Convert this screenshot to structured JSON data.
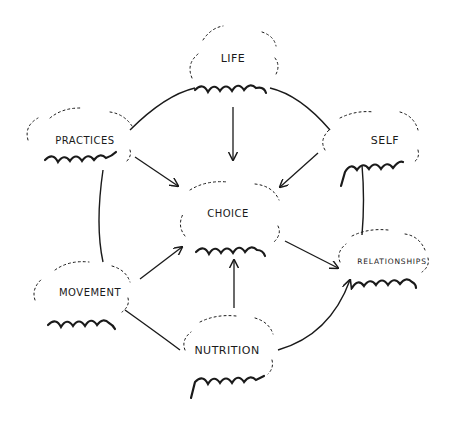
{
  "diagram": {
    "type": "concept-map",
    "center": {
      "id": "choice",
      "label": "CHOICE"
    },
    "nodes": [
      {
        "id": "life",
        "label": "LIFE",
        "x": 233,
        "y": 58
      },
      {
        "id": "practices",
        "label": "PRACTICES",
        "x": 85,
        "y": 140
      },
      {
        "id": "self",
        "label": "SELF",
        "x": 385,
        "y": 140
      },
      {
        "id": "choice",
        "label": "CHOICE",
        "x": 228,
        "y": 213
      },
      {
        "id": "movement",
        "label": "MOVEMENT",
        "x": 90,
        "y": 292
      },
      {
        "id": "relationships",
        "label": "RELATIONSHIPS",
        "x": 392,
        "y": 261
      },
      {
        "id": "nutrition",
        "label": "NUTRITION",
        "x": 227,
        "y": 350
      }
    ],
    "edges": [
      {
        "from": "life",
        "to": "choice",
        "arrow": true
      },
      {
        "from": "practices",
        "to": "choice",
        "arrow": true
      },
      {
        "from": "self",
        "to": "choice",
        "arrow": true
      },
      {
        "from": "movement",
        "to": "choice",
        "arrow": true
      },
      {
        "from": "nutrition",
        "to": "choice",
        "arrow": true
      },
      {
        "from": "choice",
        "to": "relationships",
        "arrow": true
      },
      {
        "from": "practices",
        "to": "life",
        "arrow": false
      },
      {
        "from": "life",
        "to": "self",
        "arrow": false
      },
      {
        "from": "practices",
        "to": "movement",
        "arrow": false
      },
      {
        "from": "self",
        "to": "relationships",
        "arrow": false
      },
      {
        "from": "movement",
        "to": "nutrition",
        "arrow": false
      },
      {
        "from": "nutrition",
        "to": "relationships",
        "arrow": true
      }
    ],
    "colors": {
      "stroke": "#1a1a1a",
      "background": "#ffffff"
    }
  }
}
